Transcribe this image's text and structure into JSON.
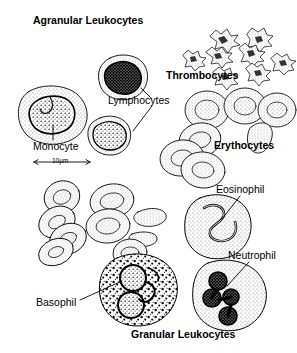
{
  "figure": {
    "title_top": "Agranular Leukocytes",
    "title_bottom": "Granular Leukocytes",
    "background_color": "#ffffff",
    "ink_color": "#000000",
    "width": 297,
    "height": 353
  },
  "headings": [
    {
      "id": "agranular",
      "text": "Agranular Leukocytes",
      "weight": "bold",
      "x": 33,
      "y": 22
    },
    {
      "id": "thrombocytes",
      "text": "Thrombocytes",
      "weight": "bold",
      "x": 166,
      "y": 76
    },
    {
      "id": "erythocytes",
      "text": "Erythocytes",
      "weight": "bold",
      "x": 214,
      "y": 146
    },
    {
      "id": "granular",
      "text": "Granular Leukocytes",
      "weight": "bold",
      "x": 131,
      "y": 335
    }
  ],
  "labels": [
    {
      "id": "lymphocytes",
      "text": "Lymphocytes",
      "weight": "plain",
      "x": 108,
      "y": 101
    },
    {
      "id": "monocyte",
      "text": "Monocyte",
      "weight": "plain",
      "x": 33,
      "y": 147
    },
    {
      "id": "eosinophil",
      "text": "Eosinophil",
      "weight": "plain",
      "x": 216,
      "y": 190
    },
    {
      "id": "neutrophil",
      "text": "Neutrophil",
      "weight": "plain",
      "x": 228,
      "y": 256
    },
    {
      "id": "basophil",
      "text": "Basophil",
      "weight": "plain",
      "x": 36,
      "y": 303
    }
  ],
  "scale_bar": {
    "text": "10µm",
    "x": 34,
    "y": 163,
    "length_px": 56,
    "represents": "10 micrometres"
  },
  "cell_groups": [
    {
      "id": "monocyte-cell",
      "name": "Monocyte",
      "category": "agranular leukocyte",
      "count": 1,
      "description": "Large cell with kidney-shaped dark nucleus and stippled cytoplasm"
    },
    {
      "id": "lymphocyte-cells",
      "name": "Lymphocytes",
      "category": "agranular leukocyte",
      "count": 2,
      "description": "Round cells with large dense dark nucleus filling most of cell"
    },
    {
      "id": "thrombocyte-cells",
      "name": "Thrombocytes",
      "category": "platelet",
      "count": 8,
      "description": "Small irregular spiky star-shaped platelet fragments"
    },
    {
      "id": "erythrocyte-cells-upper",
      "name": "Erythocytes",
      "category": "red blood cell",
      "count": 7,
      "description": "Biconcave discs with pale centres, some overlapping and one elongated"
    },
    {
      "id": "erythrocyte-cells-lower",
      "name": "Erythocytes",
      "category": "red blood cell",
      "count": 9,
      "description": "Scattered biconcave discs seen at varied angles"
    },
    {
      "id": "eosinophil-cell",
      "name": "Eosinophil",
      "category": "granular leukocyte",
      "count": 1,
      "description": "Cell with bilobed S-shaped nucleus and fine granular cytoplasm"
    },
    {
      "id": "basophil-cell",
      "name": "Basophil",
      "category": "granular leukocyte",
      "count": 1,
      "description": "Cell with coarse dark granules and pale lobed nucleus"
    },
    {
      "id": "neutrophil-cell",
      "name": "Neutrophil",
      "category": "granular leukocyte",
      "count": 1,
      "description": "Cell with multi-lobed dark nucleus linked in an S-chain"
    }
  ],
  "leader_lines": [
    {
      "id": "leader-lymphocyte-upper",
      "from": "Lymphocytes",
      "to": "upper lymphocyte"
    },
    {
      "id": "leader-lymphocyte-lower",
      "from": "Lymphocytes",
      "to": "lower lymphocyte"
    },
    {
      "id": "leader-monocyte",
      "from": "Monocyte",
      "to": "monocyte cell"
    },
    {
      "id": "leader-eosinophil",
      "from": "Eosinophil",
      "to": "eosinophil cell"
    },
    {
      "id": "leader-neutrophil",
      "from": "Neutrophil",
      "to": "neutrophil cell"
    },
    {
      "id": "leader-basophil",
      "from": "Basophil",
      "to": "basophil cell"
    }
  ]
}
